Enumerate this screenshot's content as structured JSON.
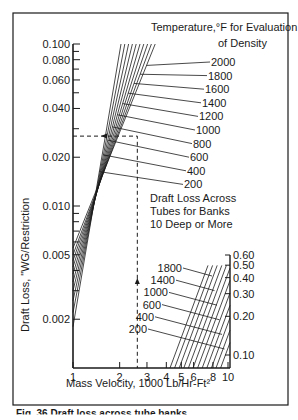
{
  "chart_data": {
    "type": "line",
    "scale": "log-log",
    "title": "Draft Loss Across Tubes for Banks 10 Deep or More",
    "xlabel": "Mass Velocity, 1000 Lb/Hr-Ft²",
    "ylabel": "Draft Loss, \"WG/Restriction",
    "legend_title": "Temperature,°F for Evaluation of Density",
    "x_ticks": [
      "1",
      "2",
      "3",
      "4",
      "5",
      "6",
      "8",
      "10"
    ],
    "y_ticks_left": [
      "0.100",
      "0.080",
      "0.060",
      "0.040",
      "0.020",
      "0.010",
      "0.005",
      "0.002"
    ],
    "y_ticks_right": [
      "0.60",
      "0.50",
      "0.40",
      "0.30",
      "0.20",
      "0.10"
    ],
    "xlim": [
      1,
      10
    ],
    "ylim_left": [
      0.0013,
      0.1
    ],
    "ylim_right": [
      0.1,
      0.6
    ],
    "grid": false,
    "series": [
      {
        "name": "200",
        "x": [
          1.0,
          3.6
        ],
        "y": [
          0.0018,
          0.04
        ]
      },
      {
        "name": "400",
        "x": [
          1.0,
          3.55
        ],
        "y": [
          0.0022,
          0.05
        ]
      },
      {
        "name": "600",
        "x": [
          1.0,
          3.5
        ],
        "y": [
          0.0026,
          0.058
        ]
      },
      {
        "name": "800",
        "x": [
          1.0,
          3.45
        ],
        "y": [
          0.003,
          0.065
        ]
      },
      {
        "name": "1000",
        "x": [
          1.0,
          3.4
        ],
        "y": [
          0.0034,
          0.072
        ]
      },
      {
        "name": "1200",
        "x": [
          1.0,
          3.35
        ],
        "y": [
          0.0038,
          0.078
        ]
      },
      {
        "name": "1400",
        "x": [
          1.0,
          3.3
        ],
        "y": [
          0.0042,
          0.084
        ]
      },
      {
        "name": "1600",
        "x": [
          1.0,
          3.25
        ],
        "y": [
          0.0046,
          0.09
        ]
      },
      {
        "name": "1800",
        "x": [
          1.0,
          3.2
        ],
        "y": [
          0.005,
          0.095
        ]
      },
      {
        "name": "2000",
        "x": [
          1.0,
          3.15
        ],
        "y": [
          0.0055,
          0.1
        ]
      }
    ],
    "inset_series_labels": [
      "1800",
      "1400",
      "1000",
      "600",
      "400",
      "200"
    ],
    "example_reading": {
      "x": 2.6,
      "y": 0.027
    }
  },
  "labels": {
    "legend_title_line1": "Temperature,°F for Evaluation",
    "legend_title_line2": "of Density",
    "annotation_line1": "Draft Loss Across",
    "annotation_line2": "Tubes for Banks",
    "annotation_line3": "10 Deep or More",
    "xlabel": "Mass Velocity, 1000 Lb/Hr-Ft²",
    "ylabel": "Draft Loss, \"WG/Restriction",
    "caption": "Fig. 36 Draft loss across tube banks"
  },
  "colors": {
    "ink": "#1a1a1a",
    "background": "#ffffff"
  }
}
